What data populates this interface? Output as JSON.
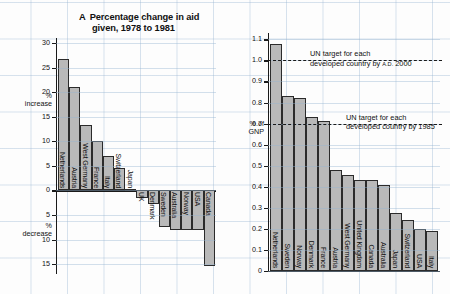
{
  "chart_data": [
    {
      "type": "bar",
      "id": "A",
      "title": "Percentage change in aid given, 1978 to 1981",
      "title_letter": "A",
      "title_line1": "Percentage change in aid",
      "title_line2": "given, 1978 to 1981",
      "xlabel": "",
      "ylabel": "% increase / % decrease",
      "ylabel_top_line1": "%",
      "ylabel_top_line2": "increase",
      "ylabel_bottom_line1": "%",
      "ylabel_bottom_line2": "decrease",
      "ylim": [
        -17,
        31
      ],
      "yticks": [
        30,
        25,
        20,
        15,
        10,
        5,
        0,
        5,
        10,
        15
      ],
      "ytick_labels": [
        "30",
        "25",
        "20",
        "15",
        "10",
        "5",
        "0",
        "5",
        "10",
        "15"
      ],
      "grid": true,
      "categories": [
        "Netherlands",
        "Austria",
        "West Germany",
        "France",
        "Italy",
        "Switzerland",
        "Japan",
        "UK",
        "Denmark",
        "Sweden",
        "Australia",
        "Norway",
        "USA",
        "Canada"
      ],
      "values": [
        26.8,
        21.0,
        13.3,
        10.0,
        7.0,
        4.5,
        0.3,
        -1.5,
        -2.7,
        -7.5,
        -8.0,
        -8.0,
        -8.0,
        -15.3
      ]
    },
    {
      "type": "bar",
      "id": "B",
      "title": "Aid as a percentage of GNP 1981",
      "title_letter": "B",
      "title_line1": "Aid as a percentage of GNP 1981",
      "xlabel": "",
      "ylabel": "% of GNP",
      "ylabel_line1": "% of",
      "ylabel_line2": "GNP",
      "ylim": [
        0,
        1.13
      ],
      "yticks": [
        1.1,
        1.0,
        0.9,
        0.8,
        0.7,
        0.6,
        0.5,
        0.4,
        0.3,
        0.2,
        0.1,
        0
      ],
      "ytick_labels": [
        "1.1",
        "1.0",
        "0.9",
        "0.8",
        "0.7",
        "0.6",
        "0.5",
        "0.4",
        "0.3",
        "0.2",
        "0.1",
        "0"
      ],
      "grid": true,
      "categories": [
        "Netherlands",
        "Sweden",
        "Norway",
        "Denmark",
        "France",
        "Austria",
        "West Germany",
        "United Kingdom",
        "Canada",
        "Australia",
        "Japan",
        "Switzerland",
        "USA",
        "Italy"
      ],
      "values": [
        1.08,
        0.83,
        0.82,
        0.73,
        0.71,
        0.48,
        0.455,
        0.43,
        0.43,
        0.41,
        0.275,
        0.24,
        0.2,
        0.19
      ],
      "annotations": [
        {
          "value": 1.0,
          "line1": "UN target for each",
          "line2_pre": "developed country by ",
          "line2_small": "A.D.",
          "line2_post": " 2000"
        },
        {
          "value": 0.7,
          "line1": "UN target for each",
          "line2_pre": "developed country by 1985",
          "line2_small": "",
          "line2_post": ""
        }
      ]
    }
  ],
  "colors": {
    "bar_fill": "#b9b9b9",
    "bar_stroke": "#2b2b2b",
    "axis": "#1a1a1a",
    "grid": "#9cb4d2",
    "background": "#fdfdfd"
  }
}
